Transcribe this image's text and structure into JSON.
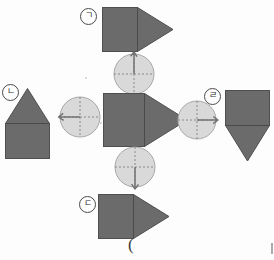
{
  "canvas": {
    "width": 274,
    "height": 260,
    "background": "#fdfdfd"
  },
  "palette": {
    "shape_fill": "#6b6b6b",
    "shape_fill_dark": "#606060",
    "shape_edge": "#4a4a4a",
    "dial_fill": "#d9d9d9",
    "dial_edge": "#a8a8a8",
    "axis": "#8a8a8a",
    "arrow": "#777777",
    "label_text": "#2e2e2e"
  },
  "diagram": {
    "type": "mental-rotation-puzzle",
    "center": {
      "name": "center-shape",
      "figure": "square-with-right-pointing-triangle",
      "direction": "right"
    },
    "dials": [
      {
        "id": "dial-up",
        "arrow_direction": "up",
        "position": "above-center",
        "rotation": "counterclockwise-90"
      },
      {
        "id": "dial-left",
        "arrow_direction": "left",
        "position": "left-of-center",
        "rotation": "counterclockwise-90"
      },
      {
        "id": "dial-right",
        "arrow_direction": "right",
        "position": "right-of-center",
        "rotation": "clockwise-90"
      },
      {
        "id": "dial-down",
        "arrow_direction": "down",
        "position": "below-center",
        "rotation": "clockwise-90"
      }
    ],
    "options": [
      {
        "key": "ㄱ",
        "id": "option-giyeok",
        "figure": "square-with-right-pointing-triangle",
        "direction": "right",
        "position": "top"
      },
      {
        "key": "ㄴ",
        "id": "option-nieun",
        "figure": "square-with-up-pointing-triangle",
        "direction": "up",
        "position": "left"
      },
      {
        "key": "ㄷ",
        "id": "option-digeut",
        "figure": "square-with-right-pointing-triangle",
        "direction": "right",
        "position": "bottom"
      },
      {
        "key": "ㄹ",
        "id": "option-rieul",
        "figure": "square-with-down-pointing-triangle",
        "direction": "down",
        "position": "right"
      }
    ],
    "footer_mark": "("
  }
}
